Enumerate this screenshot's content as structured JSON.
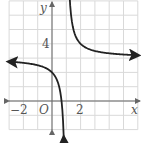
{
  "chart_data": {
    "type": "line",
    "title": "",
    "function": "y = 1/(x - 1) + 3",
    "xlabel": "x",
    "ylabel": "y",
    "origin_label": "O",
    "xlim": [
      -3,
      6
    ],
    "ylim": [
      -2,
      7
    ],
    "grid": true,
    "tick_labels": {
      "x": [
        {
          "value": -2,
          "label": "−2"
        },
        {
          "value": 2,
          "label": "2"
        }
      ],
      "y": [
        {
          "value": 4,
          "label": "4"
        }
      ]
    },
    "asymptotes": {
      "vertical": 1,
      "horizontal": 3
    },
    "series": [
      {
        "name": "left-branch",
        "x": [
          -3,
          -2,
          -1,
          0,
          0.5,
          0.75,
          0.85
        ],
        "y": [
          2.75,
          2.67,
          2.5,
          2.0,
          1.0,
          -1.0,
          -3.67
        ]
      },
      {
        "name": "right-branch",
        "x": [
          1.15,
          1.25,
          1.5,
          2,
          3,
          4,
          5,
          6
        ],
        "y": [
          9.67,
          7.0,
          5.0,
          4.0,
          3.5,
          3.33,
          3.25,
          3.2
        ]
      }
    ],
    "colors": {
      "grid": "#d9d9d9",
      "axis": "#666666",
      "curve": "#222222"
    }
  }
}
